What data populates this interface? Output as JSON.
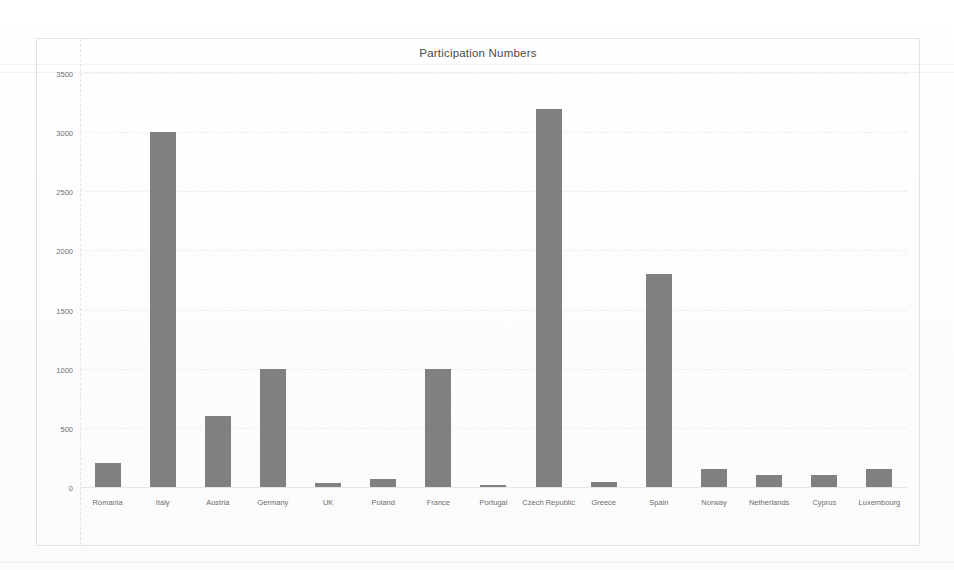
{
  "chart_data": {
    "type": "bar",
    "title": "Participation Numbers",
    "xlabel": "",
    "ylabel": "",
    "ylim": [
      0,
      3500
    ],
    "yticks": [
      0,
      500,
      1000,
      1500,
      2000,
      2500,
      3000,
      3500
    ],
    "ytick_labels": [
      "0",
      "500",
      "1000",
      "1500",
      "2000",
      "2500",
      "3000",
      "3500"
    ],
    "grid": true,
    "legend": "none",
    "bar_color": "#808080",
    "categories": [
      "Romania",
      "Italy",
      "Austria",
      "Germany",
      "UK",
      "Poland",
      "France",
      "Portugal",
      "Czech Republic",
      "Greece",
      "Spain",
      "Norway",
      "Netherlands",
      "Cyprus",
      "Luxembourg"
    ],
    "values": [
      200,
      3000,
      600,
      1000,
      30,
      70,
      1000,
      20,
      3200,
      40,
      1800,
      150,
      100,
      100,
      150
    ]
  }
}
